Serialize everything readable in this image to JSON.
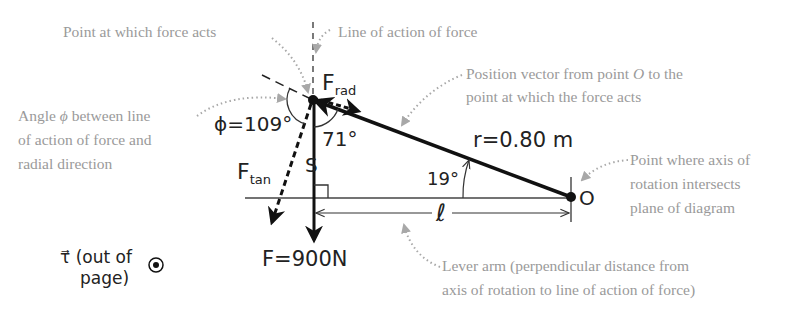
{
  "diagram": {
    "type": "torque-free-body-diagram",
    "colors": {
      "ink": "#111111",
      "caption": "#9a9a9a",
      "callout_dots": "#a8a8a8"
    },
    "captions": {
      "point_of_force": "Point at which force acts",
      "line_of_action": "Line of action of force",
      "position_vector_line1": "Position vector from point ",
      "position_vector_O": "O",
      "position_vector_line1_end": " to the",
      "position_vector_line2": "point at which the force acts",
      "angle_phi_line1_a": "Angle ",
      "angle_phi_symbol": "ϕ",
      "angle_phi_line1_b": " between line",
      "angle_phi_line2": "of action of force and",
      "angle_phi_line3": "radial direction",
      "axis_point_line1": "Point where axis of",
      "axis_point_line2": "rotation intersects",
      "axis_point_line3": "plane of diagram",
      "lever_arm_line1": "Lever arm (perpendicular distance from",
      "lever_arm_line2": "axis of rotation to line of action of force)"
    },
    "labels": {
      "F_rad_main": "F",
      "F_rad_sub": "rad",
      "F_tan_main": "F",
      "F_tan_sub": "tan",
      "phi": "ϕ=109°",
      "angle_71": "71°",
      "angle_19": "19°",
      "r_value": "r=0.80 m",
      "force_value": "F=900N",
      "lever_arm": "ℓ",
      "origin": "O",
      "right_angle_mark": "S",
      "torque_vec": "τ⃗",
      "torque_line1": "(out of",
      "torque_line2": "page)"
    },
    "values": {
      "phi_deg": 109,
      "interior_angle_deg": 71,
      "r_angle_deg": 19,
      "r_m": 0.8,
      "F_N": 900
    }
  }
}
